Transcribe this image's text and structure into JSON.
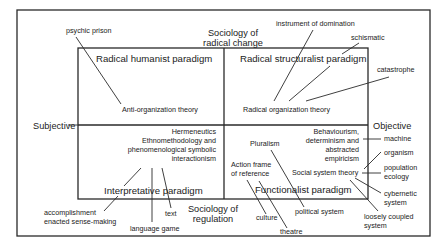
{
  "diagram": {
    "type": "four-paradigm matrix",
    "axes": {
      "top": [
        "Sociology of",
        "radical change"
      ],
      "bottom": [
        "Sociology of",
        "regulation"
      ],
      "left": "Subjective",
      "right": "Objective"
    },
    "quadrants": {
      "top_left": {
        "title": "Radical humanist paradigm",
        "theory": "Anti-organization theory",
        "metaphors": [
          "psychic prison"
        ]
      },
      "top_right": {
        "title": "Radical structuralist paradigm",
        "theory": "Radical organization theory",
        "metaphors": [
          "instrument of domination",
          "schismatic",
          "catastrophe"
        ]
      },
      "bottom_left": {
        "title": "Interpretative paradigm",
        "theories": [
          "Hermeneutics",
          "Ethnomethodology and",
          "phenomenological symbolic",
          "interactionism"
        ],
        "metaphors": [
          "accomplishment",
          "enacted sense-making",
          "language game",
          "text"
        ]
      },
      "bottom_right": {
        "title": "Functionalist paradigm",
        "theories": {
          "pluralism": "Pluralism",
          "action": [
            "Action frame",
            "of reference"
          ],
          "behaviourism": [
            "Behaviourism,",
            "determinism and",
            "abstracted",
            "empiricism"
          ],
          "social_system": "Social system theory"
        },
        "metaphors": {
          "machine": "machine",
          "organism": "organism",
          "population_ecology": [
            "population",
            "ecology"
          ],
          "cybernetic": [
            "cybernetic",
            "system"
          ],
          "loosely_coupled": [
            "loosely coupled",
            "system"
          ],
          "political": "political system",
          "culture": "culture",
          "theatre": "theatre"
        }
      }
    },
    "colors": {
      "line": "#2a2a2a",
      "text": "#222222",
      "background": "#ffffff"
    }
  }
}
